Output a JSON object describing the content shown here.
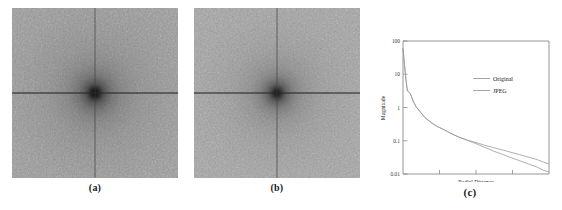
{
  "figure": {
    "panels": [
      {
        "id": "a",
        "label": "(a)",
        "kind": "fft-magnitude-spectrum",
        "caption_position": "below"
      },
      {
        "id": "b",
        "label": "(b)",
        "kind": "fft-magnitude-spectrum",
        "caption_position": "below"
      },
      {
        "id": "c",
        "label": "(c)",
        "kind": "line-plot",
        "caption_position": "below"
      }
    ]
  },
  "colors": {
    "background": "#ffffff",
    "spectrum_base": "#9c9c9c",
    "axis": "#8a8a8a",
    "curve_original": "#9a9a9a",
    "curve_jpeg": "#9a9a9a",
    "text": "#222222"
  },
  "chart_data": {
    "type": "line",
    "title": "",
    "xlabel": "Radial Distance",
    "ylabel": "Magnitude",
    "yscale": "log",
    "ylim": [
      0.01,
      100
    ],
    "ytick_labels": [
      "100",
      "10",
      "1",
      "0.1",
      "0.01"
    ],
    "ytick_values": [
      100,
      10,
      1,
      0.1,
      0.01
    ],
    "xtick_labels": [
      "",
      "",
      "",
      "",
      ""
    ],
    "xlim": [
      0,
      1
    ],
    "grid": false,
    "legend_position": "upper-right",
    "series": [
      {
        "name": "Original",
        "x": [
          0.0,
          0.01,
          0.02,
          0.03,
          0.05,
          0.07,
          0.09,
          0.12,
          0.15,
          0.19,
          0.23,
          0.28,
          0.33,
          0.38,
          0.44,
          0.5,
          0.56,
          0.62,
          0.68,
          0.74,
          0.8,
          0.86,
          0.92,
          0.96,
          1.0
        ],
        "y": [
          60,
          20,
          7.0,
          3.2,
          2.6,
          1.55,
          1.05,
          0.72,
          0.5,
          0.36,
          0.275,
          0.215,
          0.165,
          0.13,
          0.105,
          0.088,
          0.073,
          0.062,
          0.053,
          0.045,
          0.038,
          0.032,
          0.027,
          0.023,
          0.02
        ]
      },
      {
        "name": "JPEG",
        "x": [
          0.0,
          0.01,
          0.02,
          0.03,
          0.05,
          0.07,
          0.09,
          0.12,
          0.15,
          0.19,
          0.23,
          0.28,
          0.33,
          0.38,
          0.44,
          0.5,
          0.56,
          0.62,
          0.68,
          0.74,
          0.8,
          0.86,
          0.92,
          0.96,
          1.0
        ],
        "y": [
          60,
          20,
          7.0,
          3.2,
          2.6,
          1.55,
          1.05,
          0.72,
          0.5,
          0.36,
          0.275,
          0.215,
          0.165,
          0.13,
          0.103,
          0.082,
          0.063,
          0.049,
          0.039,
          0.031,
          0.025,
          0.02,
          0.016,
          0.013,
          0.0115
        ]
      }
    ]
  }
}
